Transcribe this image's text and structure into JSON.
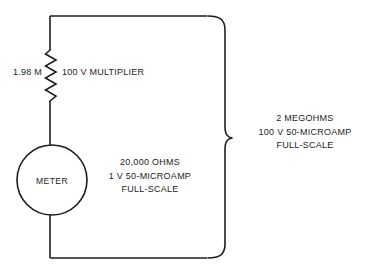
{
  "diagram": {
    "type": "circuit-schematic",
    "colors": {
      "background": "#ffffff",
      "line": "#1d1d1d",
      "text": "#1d1d1d"
    },
    "components": {
      "resistor": {
        "symbol": "zigzag-resistor",
        "value_label": "1.98 M",
        "name_label": "100 V MULTIPLIER"
      },
      "meter": {
        "symbol": "circle-meter",
        "label": "METER",
        "specs": [
          "20,000 OHMS",
          "1 V 50-MICROAMP",
          "FULL-SCALE"
        ],
        "specs_text": "20,000 OHMS\n1 V 50-MICROAMP\nFULL-SCALE"
      },
      "total_brace": {
        "symbol": "curly-brace-right",
        "specs": [
          "2 MEGOHMS",
          "100 V 50-MICROAMP",
          "FULL-SCALE"
        ],
        "specs_text": "2 MEGOHMS\n100 V 50-MICROAMP\nFULL-SCALE"
      }
    }
  }
}
